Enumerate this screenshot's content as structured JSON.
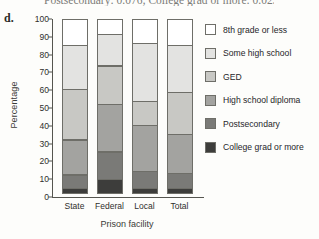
{
  "part_label": "d.",
  "top_fragment": "Postsecondary: 0.076; College grad or more: 0.023",
  "chart_data": {
    "type": "bar",
    "subtype": "stacked-bar-100",
    "title": "",
    "xlabel": "Prison facility",
    "ylabel": "Percentage",
    "categories": [
      "State",
      "Federal",
      "Local",
      "Total"
    ],
    "ylim": [
      0,
      100
    ],
    "yticks": [
      0,
      10,
      20,
      30,
      40,
      50,
      60,
      70,
      80,
      90,
      100
    ],
    "grid": false,
    "legend_position": "right",
    "series": [
      {
        "name": "8th grade or less",
        "color": "#ffffff",
        "values": [
          15,
          9,
          14,
          15
        ]
      },
      {
        "name": "Some high school",
        "color": "#e3e3e1",
        "values": [
          25,
          18,
          33,
          27
        ]
      },
      {
        "name": "GED",
        "color": "#c8c8c4",
        "values": [
          29,
          22,
          14,
          24
        ]
      },
      {
        "name": "High school diploma",
        "color": "#a3a3a0",
        "values": [
          20,
          27,
          26,
          22
        ]
      },
      {
        "name": "Postsecondary",
        "color": "#7a7a77",
        "values": [
          8,
          16,
          10,
          9
        ]
      },
      {
        "name": "College grad or more",
        "color": "#3d3d3b",
        "values": [
          3,
          8,
          3,
          3
        ]
      }
    ]
  }
}
